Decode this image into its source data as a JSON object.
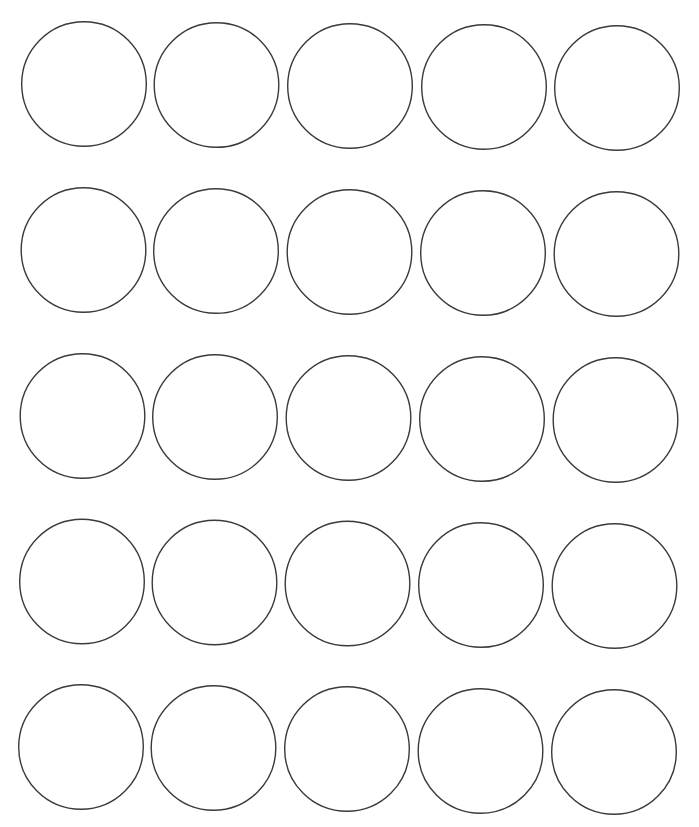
{
  "page": {
    "background": "#ffffff",
    "width": 699,
    "height": 827
  },
  "circle_style": {
    "radius": 62.3,
    "stroke": "#3a3a3a",
    "stroke_width": 1.4,
    "fill": "none"
  },
  "grid": {
    "rows": 5,
    "columns": 5,
    "circles": [
      [
        {
          "cx": 84,
          "cy": 84
        },
        {
          "cx": 216.5,
          "cy": 85
        },
        {
          "cx": 350,
          "cy": 86
        },
        {
          "cx": 484,
          "cy": 87
        },
        {
          "cx": 617,
          "cy": 88
        }
      ],
      [
        {
          "cx": 83.5,
          "cy": 250
        },
        {
          "cx": 216,
          "cy": 251
        },
        {
          "cx": 349.5,
          "cy": 252
        },
        {
          "cx": 483,
          "cy": 253
        },
        {
          "cx": 616.5,
          "cy": 254
        }
      ],
      [
        {
          "cx": 82.5,
          "cy": 416
        },
        {
          "cx": 215,
          "cy": 417
        },
        {
          "cx": 348.5,
          "cy": 418
        },
        {
          "cx": 482,
          "cy": 419
        },
        {
          "cx": 615.5,
          "cy": 420
        }
      ],
      [
        {
          "cx": 82,
          "cy": 581.5
        },
        {
          "cx": 214.5,
          "cy": 582.5
        },
        {
          "cx": 347.5,
          "cy": 583.5
        },
        {
          "cx": 481,
          "cy": 585
        },
        {
          "cx": 614.5,
          "cy": 586
        }
      ],
      [
        {
          "cx": 81,
          "cy": 747
        },
        {
          "cx": 213.5,
          "cy": 748
        },
        {
          "cx": 347,
          "cy": 749
        },
        {
          "cx": 480.5,
          "cy": 751
        },
        {
          "cx": 614,
          "cy": 752
        }
      ]
    ]
  }
}
